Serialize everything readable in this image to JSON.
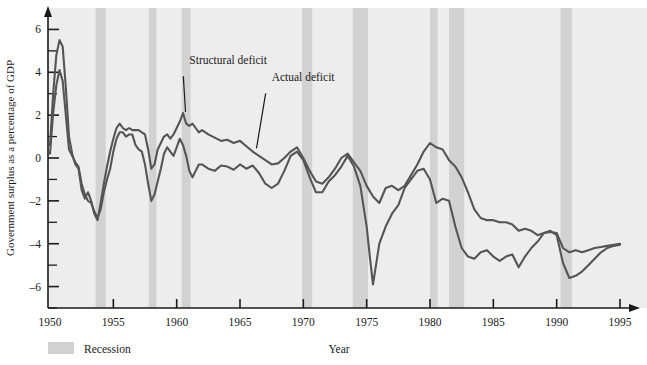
{
  "chart_data": {
    "type": "line",
    "title": "",
    "xlabel": "Year",
    "ylabel": "Government surplus as a percentage of GDP",
    "xlim": [
      1950,
      1995
    ],
    "ylim": [
      -7,
      7
    ],
    "xticks": [
      1950,
      1955,
      1960,
      1965,
      1970,
      1975,
      1980,
      1985,
      1990,
      1995
    ],
    "xtick_labels": [
      "1950",
      "1955",
      "1960",
      "1965",
      "1970",
      "1975",
      "1980",
      "1985",
      "1990",
      "1995"
    ],
    "yticks": [
      -6,
      -4,
      -2,
      0,
      2,
      4,
      6
    ],
    "ytick_labels": [
      "–6",
      "–4",
      "–2",
      "0",
      "2",
      "4",
      "6"
    ],
    "yminorticks": [
      -7,
      -5,
      -3,
      -1,
      1,
      3,
      5
    ],
    "grid": false,
    "legend_position": "below-left",
    "legend": [
      {
        "label": "Recession",
        "type": "band",
        "color": "#d2d2d2"
      }
    ],
    "annotations": [
      {
        "text": "Structural deficit",
        "x": 1961.0,
        "y": 4.0,
        "points_to_x": 1960.7,
        "points_to_y": 2.15
      },
      {
        "text": "Actual deficit",
        "x": 1967.5,
        "y": 3.2,
        "points_to_x": 1966.3,
        "points_to_y": 0.45
      }
    ],
    "recession_bands": [
      {
        "start": 1953.6,
        "end": 1954.4
      },
      {
        "start": 1957.8,
        "end": 1958.4
      },
      {
        "start": 1960.4,
        "end": 1961.1
      },
      {
        "start": 1969.9,
        "end": 1970.7
      },
      {
        "start": 1973.9,
        "end": 1975.1
      },
      {
        "start": 1980.0,
        "end": 1980.6
      },
      {
        "start": 1981.5,
        "end": 1982.7
      },
      {
        "start": 1990.3,
        "end": 1991.2
      }
    ],
    "series": [
      {
        "name": "Actual deficit",
        "color": "#555555",
        "x": [
          1950.0,
          1950.25,
          1950.5,
          1950.75,
          1951.0,
          1951.25,
          1951.5,
          1951.75,
          1952.0,
          1952.25,
          1952.5,
          1952.75,
          1953.0,
          1953.25,
          1953.5,
          1953.75,
          1954.0,
          1954.25,
          1954.5,
          1954.75,
          1955.0,
          1955.25,
          1955.5,
          1955.75,
          1956.0,
          1956.25,
          1956.5,
          1956.75,
          1957.0,
          1957.25,
          1957.5,
          1957.75,
          1958.0,
          1958.25,
          1958.5,
          1958.75,
          1959.0,
          1959.25,
          1959.5,
          1959.75,
          1960.0,
          1960.25,
          1960.5,
          1960.75,
          1961.0,
          1961.25,
          1961.5,
          1961.75,
          1962.0,
          1962.5,
          1963.0,
          1963.5,
          1964.0,
          1964.5,
          1965.0,
          1965.5,
          1966.0,
          1966.5,
          1967.0,
          1967.5,
          1968.0,
          1968.5,
          1969.0,
          1969.5,
          1970.0,
          1970.5,
          1971.0,
          1971.5,
          1972.0,
          1972.5,
          1973.0,
          1973.5,
          1974.0,
          1974.5,
          1975.0,
          1975.25,
          1975.5,
          1976.0,
          1976.5,
          1977.0,
          1977.5,
          1978.0,
          1978.5,
          1979.0,
          1979.5,
          1980.0,
          1980.5,
          1981.0,
          1981.5,
          1982.0,
          1982.5,
          1983.0,
          1983.5,
          1984.0,
          1984.5,
          1985.0,
          1985.5,
          1986.0,
          1986.5,
          1987.0,
          1987.5,
          1988.0,
          1988.5,
          1989.0,
          1989.5,
          1990.0,
          1990.5,
          1991.0,
          1991.5,
          1992.0,
          1992.5,
          1993.0,
          1993.5,
          1994.0,
          1994.5,
          1995.0
        ],
        "y": [
          0.2,
          2.1,
          3.4,
          4.1,
          3.6,
          2.0,
          0.4,
          0.1,
          -0.2,
          -0.4,
          -1.2,
          -1.7,
          -2.0,
          -2.1,
          -2.5,
          -2.8,
          -2.4,
          -1.6,
          -1.0,
          -0.5,
          0.3,
          0.9,
          1.2,
          1.2,
          1.0,
          1.1,
          1.1,
          0.6,
          0.4,
          0.3,
          -0.3,
          -1.2,
          -2.0,
          -1.7,
          -1.1,
          -0.5,
          0.2,
          0.5,
          0.3,
          0.1,
          0.5,
          0.9,
          0.6,
          0.1,
          -0.6,
          -0.9,
          -0.6,
          -0.3,
          -0.3,
          -0.5,
          -0.6,
          -0.35,
          -0.4,
          -0.55,
          -0.3,
          -0.5,
          -0.35,
          -0.7,
          -1.2,
          -1.4,
          -1.2,
          -0.6,
          0.1,
          0.3,
          -0.1,
          -0.9,
          -1.6,
          -1.6,
          -1.1,
          -0.8,
          -0.4,
          0.1,
          -0.4,
          -1.3,
          -3.2,
          -4.6,
          -5.9,
          -4.0,
          -3.2,
          -2.6,
          -2.2,
          -1.4,
          -1.0,
          -0.6,
          -0.5,
          -1.0,
          -2.1,
          -1.9,
          -2.0,
          -3.2,
          -4.2,
          -4.6,
          -4.7,
          -4.4,
          -4.3,
          -4.6,
          -4.8,
          -4.6,
          -4.5,
          -5.1,
          -4.6,
          -4.2,
          -3.9,
          -3.5,
          -3.4,
          -3.6,
          -4.9,
          -5.6,
          -5.5,
          -5.3,
          -5.0,
          -4.7,
          -4.4,
          -4.2,
          -4.1,
          -4.05
        ]
      },
      {
        "name": "Structural deficit",
        "color": "#555555",
        "x": [
          1950.0,
          1950.25,
          1950.5,
          1950.75,
          1951.0,
          1951.25,
          1951.5,
          1951.75,
          1952.0,
          1952.25,
          1952.5,
          1952.75,
          1953.0,
          1953.25,
          1953.5,
          1953.75,
          1954.0,
          1954.25,
          1954.5,
          1954.75,
          1955.0,
          1955.25,
          1955.5,
          1955.75,
          1956.0,
          1956.25,
          1956.5,
          1956.75,
          1957.0,
          1957.25,
          1957.5,
          1957.75,
          1958.0,
          1958.25,
          1958.5,
          1958.75,
          1959.0,
          1959.25,
          1959.5,
          1959.75,
          1960.0,
          1960.25,
          1960.5,
          1960.75,
          1961.0,
          1961.25,
          1961.5,
          1961.75,
          1962.0,
          1962.5,
          1963.0,
          1963.5,
          1964.0,
          1964.5,
          1965.0,
          1965.5,
          1966.0,
          1966.5,
          1967.0,
          1967.5,
          1968.0,
          1968.5,
          1969.0,
          1969.5,
          1970.0,
          1970.5,
          1971.0,
          1971.5,
          1972.0,
          1972.5,
          1973.0,
          1973.5,
          1974.0,
          1974.5,
          1975.0,
          1975.5,
          1976.0,
          1976.5,
          1977.0,
          1977.5,
          1978.0,
          1978.5,
          1979.0,
          1979.5,
          1980.0,
          1980.5,
          1981.0,
          1981.5,
          1982.0,
          1982.5,
          1983.0,
          1983.5,
          1984.0,
          1984.5,
          1985.0,
          1985.5,
          1986.0,
          1986.5,
          1987.0,
          1987.5,
          1988.0,
          1988.5,
          1989.0,
          1989.5,
          1990.0,
          1990.5,
          1991.0,
          1991.5,
          1992.0,
          1992.5,
          1993.0,
          1993.5,
          1994.0,
          1994.5,
          1995.0
        ],
        "y": [
          0.6,
          3.0,
          4.8,
          5.5,
          5.2,
          3.3,
          1.0,
          0.2,
          -0.3,
          -0.5,
          -1.5,
          -1.9,
          -1.6,
          -2.0,
          -2.6,
          -2.9,
          -2.1,
          -1.2,
          -0.4,
          0.3,
          0.9,
          1.4,
          1.6,
          1.4,
          1.3,
          1.4,
          1.3,
          1.3,
          1.3,
          1.2,
          1.1,
          0.4,
          -0.5,
          -0.3,
          0.4,
          0.7,
          1.0,
          1.1,
          0.9,
          1.1,
          1.4,
          1.7,
          2.1,
          1.6,
          1.5,
          1.6,
          1.4,
          1.2,
          1.3,
          1.1,
          0.95,
          0.8,
          0.85,
          0.7,
          0.8,
          0.55,
          0.3,
          0.1,
          -0.1,
          -0.3,
          -0.25,
          0.0,
          0.3,
          0.5,
          0.0,
          -0.6,
          -1.1,
          -1.2,
          -0.9,
          -0.5,
          0.0,
          0.2,
          -0.2,
          -0.6,
          -1.3,
          -1.8,
          -2.1,
          -1.4,
          -1.3,
          -1.5,
          -1.3,
          -0.8,
          -0.3,
          0.3,
          0.7,
          0.5,
          0.4,
          -0.1,
          -0.4,
          -0.9,
          -1.6,
          -2.4,
          -2.8,
          -2.9,
          -2.9,
          -3.0,
          -3.0,
          -3.1,
          -3.4,
          -3.3,
          -3.4,
          -3.6,
          -3.5,
          -3.45,
          -3.5,
          -4.2,
          -4.4,
          -4.3,
          -4.4,
          -4.3,
          -4.2,
          -4.15,
          -4.1,
          -4.05,
          -4.0
        ]
      }
    ]
  },
  "legend": {
    "recession_label": "Recession"
  },
  "axis": {
    "x_title": "Year",
    "y_title": "Government surplus as a percentage of GDP"
  }
}
